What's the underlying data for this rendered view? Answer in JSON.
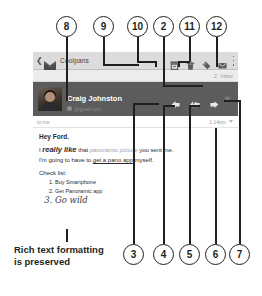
{
  "callouts": {
    "top": [
      {
        "num": "8",
        "x": 56,
        "y": 16
      },
      {
        "num": "9",
        "x": 93,
        "y": 16
      },
      {
        "num": "10",
        "x": 127,
        "y": 16
      },
      {
        "num": "2",
        "x": 153,
        "y": 16
      },
      {
        "num": "11",
        "x": 179,
        "y": 16
      },
      {
        "num": "12",
        "x": 206,
        "y": 16
      }
    ],
    "bottom": [
      {
        "num": "3",
        "x": 123,
        "y": 244
      },
      {
        "num": "4",
        "x": 153,
        "y": 244
      },
      {
        "num": "5",
        "x": 179,
        "y": 244
      },
      {
        "num": "6",
        "x": 205,
        "y": 244
      },
      {
        "num": "7",
        "x": 229,
        "y": 244
      }
    ]
  },
  "caption": {
    "text": "Rich text formatting is preserved"
  },
  "app": {
    "back_icon": "chevron-left-icon",
    "logo_icon": "gmail-m-icon",
    "title": "Coolpans",
    "toolbar": [
      {
        "name": "archive-icon",
        "label": "Archive"
      },
      {
        "name": "trash-icon",
        "label": "Delete"
      },
      {
        "name": "label-icon",
        "label": "Labels"
      },
      {
        "name": "mark-unread-icon",
        "label": "Mark unread"
      }
    ],
    "overflow_icon": "overflow-menu-icon",
    "subbar": {
      "counter": "2",
      "label": "Inbox"
    }
  },
  "message": {
    "sender_name": "Craig Johnston",
    "sender_email": "@gmail.com",
    "presence_icon": "presence-dot-icon",
    "actions": [
      {
        "name": "reply-icon",
        "label": "Reply"
      },
      {
        "name": "reply-all-icon",
        "label": "Reply all"
      },
      {
        "name": "forward-icon",
        "label": "Forward"
      }
    ],
    "star_icon": "star-icon",
    "star_glyph": "★",
    "to": "to me",
    "time": "1:14pm",
    "expand_icon": "chevron-down-icon",
    "greeting": "Hey Ford.",
    "line1_a": "I ",
    "line1_b": "really like",
    "line1_c": " that ",
    "line1_d": "panoramic picture",
    "line1_e": " you sent me.",
    "line2_a": "I'm going to have to ",
    "line2_b": "get a pano app",
    "line2_c": " myself.",
    "check_label": "Check list:",
    "list": [
      "Buy Smartphone",
      "Get Panoramic app",
      "Go wild"
    ]
  },
  "colors": {
    "appbar": "#dcdcdc",
    "sender_band": "#5c5c5c",
    "ink": "#231f20",
    "muted": "#9b9b9b",
    "link_grey": "#9d9dab"
  }
}
